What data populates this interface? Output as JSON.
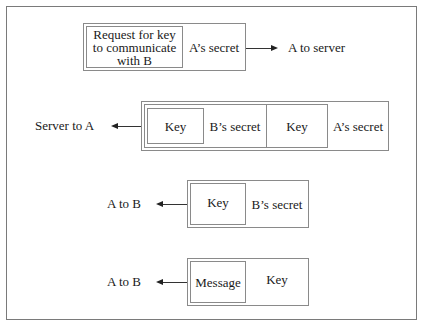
{
  "diagram": {
    "title": "",
    "steps": [
      {
        "direction_label": "A to server",
        "arrow": "right",
        "fields": [
          "Request for key to communicate with B",
          "A’s secret"
        ],
        "request_lines": [
          "Request  for key",
          "to communicate",
          "with B"
        ],
        "secret": "A’s   secret"
      },
      {
        "direction_label": "Server to A",
        "arrow": "left",
        "inner_key": "Key",
        "inner_secret": "B’s  secret",
        "outer_key": "Key",
        "outer_secret": "A’s secret"
      },
      {
        "direction_label": "A to B",
        "arrow": "left",
        "inner": "Key",
        "secret": "B’s secret"
      },
      {
        "direction_label": "A to B",
        "arrow": "left",
        "inner": "Message",
        "key": "Key"
      }
    ],
    "colors": {
      "border": "#8a8a8a",
      "frame": "#7a7a7a",
      "text": "#1a1a1a",
      "arrow": "#222222"
    }
  }
}
